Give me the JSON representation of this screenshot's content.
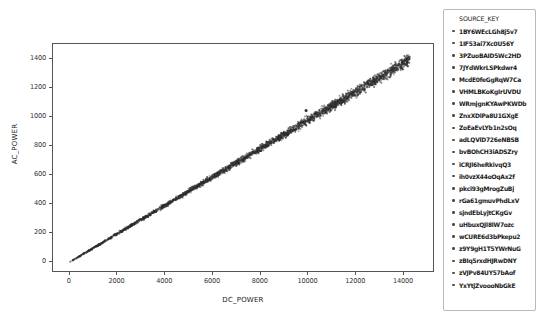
{
  "chart_data": {
    "type": "scatter",
    "title": "",
    "xlabel": "DC_POWER",
    "ylabel": "AC_POWER",
    "xlim": [
      -700,
      15300
    ],
    "ylim": [
      -75,
      1500
    ],
    "xticks": [
      0,
      2000,
      4000,
      6000,
      8000,
      10000,
      12000,
      14000
    ],
    "yticks": [
      0,
      200,
      400,
      600,
      800,
      1000,
      1200,
      1400
    ],
    "xtick_labels": [
      "0",
      "2000",
      "4000",
      "6000",
      "8000",
      "10000",
      "12000",
      "14000"
    ],
    "ytick_labels": [
      "0",
      "200",
      "400",
      "600",
      "800",
      "1000",
      "1200",
      "1400"
    ],
    "grid": false,
    "legend_position": "right-outside",
    "legend_title": "SOURCE_KEY",
    "marker_color": "#3a3a3a",
    "marker_size": 1.6,
    "relationship": "linear",
    "slope": 0.0978,
    "intercept": 0.0,
    "note": "AC_POWER is almost exactly proportional to DC_POWER (ratio ~0.098); points form a tight narrow band from the origin up to ~14200 DC / ~1390 AC, with one isolated outlier near (9900, 1040).",
    "outliers": [
      {
        "x": 9900,
        "y": 1042
      }
    ],
    "series": [
      {
        "name": "1BY6WEcLGh8j5v7",
        "color": "#4c4c4c"
      },
      {
        "name": "1IF53ai7Xc0U56Y",
        "color": "#4c4c4c"
      },
      {
        "name": "3PZuoBAID5Wc2HD",
        "color": "#4c4c4c"
      },
      {
        "name": "7JYdWkrLSPkdwr4",
        "color": "#4c4c4c"
      },
      {
        "name": "McdE0feGgRqW7Ca",
        "color": "#4c4c4c"
      },
      {
        "name": "VHMLBKoKgIrUVDU",
        "color": "#4c4c4c"
      },
      {
        "name": "WRmjgnKYAwPKWDb",
        "color": "#4c4c4c"
      },
      {
        "name": "ZnxXDlPa8U1GXgE",
        "color": "#4c4c4c"
      },
      {
        "name": "ZoEaEvLYb1n2sOq",
        "color": "#4c4c4c"
      },
      {
        "name": "adLQVlD726eNBSB",
        "color": "#4c4c4c"
      },
      {
        "name": "bvBOhCH3iADSZry",
        "color": "#4c4c4c"
      },
      {
        "name": "iCRJl6heRkivqQ3",
        "color": "#4c4c4c"
      },
      {
        "name": "ih0vzX44oOqAx2f",
        "color": "#4c4c4c"
      },
      {
        "name": "pkci93gMrogZuBj",
        "color": "#4c4c4c"
      },
      {
        "name": "rGa61gmuvPhdLxV",
        "color": "#4c4c4c"
      },
      {
        "name": "sjndEbLyjtCKgGv",
        "color": "#4c4c4c"
      },
      {
        "name": "uHbuxQJl8lW7ozc",
        "color": "#4c4c4c"
      },
      {
        "name": "wCURE6d3bPkepu2",
        "color": "#4c4c4c"
      },
      {
        "name": "z9Y9gH1T5YWrNuG",
        "color": "#4c4c4c"
      },
      {
        "name": "zBIq5rxdHJRwDNY",
        "color": "#4c4c4c"
      },
      {
        "name": "zVJPv84UY57bAof",
        "color": "#4c4c4c"
      },
      {
        "name": "YxYtjZvoooNbGkE",
        "color": "#4c4c4c"
      }
    ]
  }
}
